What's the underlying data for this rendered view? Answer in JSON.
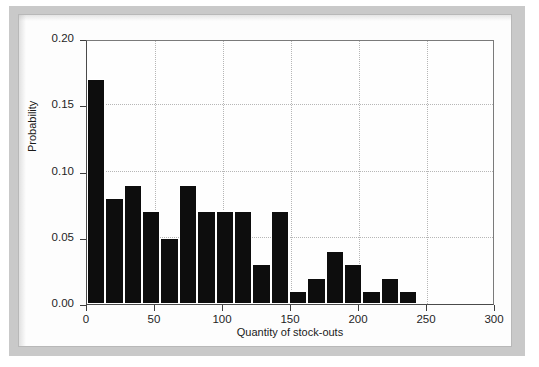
{
  "chart_data": {
    "type": "bar",
    "title": "",
    "subtitle": "",
    "xlabel": "Quantity of stock-outs",
    "ylabel": "Probability",
    "xlim": [
      0,
      300
    ],
    "ylim": [
      0,
      0.2
    ],
    "grid": true,
    "legend": null,
    "bar_width": 13.5,
    "x_tick_labels": [
      "0",
      "50",
      "100",
      "150",
      "200",
      "250",
      "300"
    ],
    "x_tick_values": [
      0,
      50,
      100,
      150,
      200,
      250,
      300
    ],
    "y_tick_labels": [
      "0.00",
      "0.05",
      "0.10",
      "0.15",
      "0.20"
    ],
    "y_tick_values": [
      0.0,
      0.05,
      0.1,
      0.15,
      0.2
    ],
    "bar_color": "#0d0d0d",
    "x": [
      0,
      13.5,
      27,
      40.5,
      54,
      67.5,
      81,
      94.5,
      108,
      121.5,
      135,
      148.5,
      162,
      175.5,
      189,
      202.5,
      216,
      229.5,
      243,
      256.5
    ],
    "bin_edges": [
      0,
      13.5,
      27,
      40.5,
      54,
      67.5,
      81,
      94.5,
      108,
      121.5,
      135,
      148.5,
      162,
      175.5,
      189,
      202.5,
      216,
      229.5,
      243,
      256.5,
      270
    ],
    "categories": [
      "0-13.5",
      "13.5-27",
      "27-40.5",
      "40.5-54",
      "54-67.5",
      "67.5-81",
      "81-94.5",
      "94.5-108",
      "108-121.5",
      "121.5-135",
      "135-148.5",
      "148.5-162",
      "162-175.5",
      "175.5-189",
      "189-202.5",
      "202.5-216",
      "216-229.5",
      "229.5-243",
      "243-256.5",
      "256.5-270"
    ],
    "values": [
      0.17,
      0.08,
      0.09,
      0.07,
      0.05,
      0.09,
      0.07,
      0.07,
      0.07,
      0.03,
      0.07,
      0.01,
      0.02,
      0.04,
      0.03,
      0.01,
      0.02,
      0.01,
      0.0,
      0.0
    ]
  },
  "figure": {
    "caption": ""
  }
}
